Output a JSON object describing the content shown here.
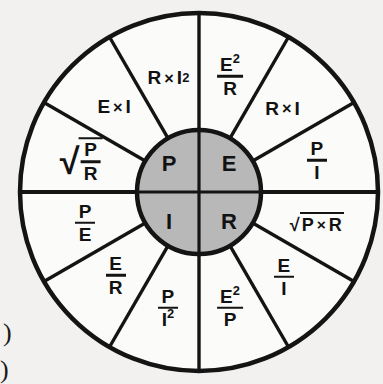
{
  "diagram": {
    "type": "ohms-law-wheel",
    "geometry": {
      "center_x": 199,
      "center_y": 192,
      "outer_radius": 179,
      "ring_inner_radius": 62,
      "hub_radius": 62,
      "sector_count": 12,
      "sector_span_degrees": 30
    },
    "colors": {
      "background": "#f2f1ef",
      "hub_fill": "#b8b8b8",
      "sector_fill": "#fbfbfa",
      "stroke": "#141414",
      "text": "#121212"
    }
  },
  "hub": {
    "label": "quantities",
    "quadrants": [
      {
        "name": "power",
        "symbol": "P",
        "position": "top-left"
      },
      {
        "name": "voltage",
        "symbol": "E",
        "position": "top-right"
      },
      {
        "name": "current",
        "symbol": "I",
        "position": "bottom-left"
      },
      {
        "name": "resistance",
        "symbol": "R",
        "position": "bottom-right"
      }
    ]
  },
  "sectors": [
    {
      "id": "p-e2-over-r",
      "quantity": "P",
      "kind": "fraction",
      "numerator": "E",
      "numerator_exp": "2",
      "denominator": "R",
      "plain": "E² / R",
      "angle_deg": -75,
      "label_radius": 120,
      "font_size": 19
    },
    {
      "id": "e-r-times-i",
      "quantity": "E",
      "kind": "product",
      "left": "R",
      "operator": "×",
      "right": "I",
      "plain": "R × I",
      "angle_deg": -45,
      "label_radius": 118,
      "font_size": 19
    },
    {
      "id": "e-p-over-i",
      "quantity": "E",
      "kind": "fraction",
      "numerator": "P",
      "denominator": "I",
      "plain": "P / I",
      "angle_deg": -15,
      "label_radius": 122,
      "font_size": 19
    },
    {
      "id": "e-sqrt-p-times-r",
      "quantity": "E",
      "kind": "radical-product",
      "left": "P",
      "operator": "×",
      "right": "R",
      "plain": "√(P × R)",
      "angle_deg": 15,
      "label_radius": 122,
      "font_size": 18
    },
    {
      "id": "r-e-over-i",
      "quantity": "R",
      "kind": "fraction",
      "numerator": "E",
      "denominator": "I",
      "plain": "E / I",
      "angle_deg": 45,
      "label_radius": 120,
      "font_size": 19
    },
    {
      "id": "r-e2-over-p",
      "quantity": "R",
      "kind": "fraction",
      "numerator": "E",
      "numerator_exp": "2",
      "denominator": "P",
      "plain": "E² / P",
      "angle_deg": 75,
      "label_radius": 120,
      "font_size": 19
    },
    {
      "id": "r-p-over-i2",
      "quantity": "R",
      "kind": "fraction",
      "numerator": "P",
      "denominator": "I",
      "denominator_exp": "2",
      "plain": "P / I²",
      "angle_deg": 105,
      "label_radius": 120,
      "font_size": 19
    },
    {
      "id": "i-e-over-r",
      "quantity": "I",
      "kind": "fraction",
      "numerator": "E",
      "denominator": "R",
      "plain": "E / R",
      "angle_deg": 135,
      "label_radius": 118,
      "font_size": 19
    },
    {
      "id": "i-p-over-e",
      "quantity": "I",
      "kind": "fraction",
      "numerator": "P",
      "denominator": "E",
      "plain": "P / E",
      "angle_deg": 165,
      "label_radius": 118,
      "font_size": 19
    },
    {
      "id": "i-sqrt-p-over-r",
      "quantity": "I",
      "kind": "radical-fraction",
      "numerator": "P",
      "denominator": "R",
      "plain": "√(P / R)",
      "angle_deg": 195,
      "label_radius": 122,
      "font_size": 19
    },
    {
      "id": "p-e-times-i",
      "quantity": "P",
      "kind": "product",
      "left": "E",
      "operator": "×",
      "right": "I",
      "plain": "E × I",
      "angle_deg": 225,
      "label_radius": 120,
      "font_size": 19
    },
    {
      "id": "p-r-times-i2",
      "quantity": "P",
      "kind": "product",
      "left": "R",
      "operator": "×",
      "right": "I",
      "right_exp": "2",
      "plain": "R × I²",
      "angle_deg": 255,
      "label_radius": 118,
      "font_size": 19
    }
  ],
  "page_artifacts": [
    {
      "id": "paren-upper",
      "glyph": ")",
      "x": 3,
      "y": 318,
      "size": 26
    },
    {
      "id": "paren-lower",
      "glyph": ")",
      "x": 0,
      "y": 355,
      "size": 26
    }
  ]
}
